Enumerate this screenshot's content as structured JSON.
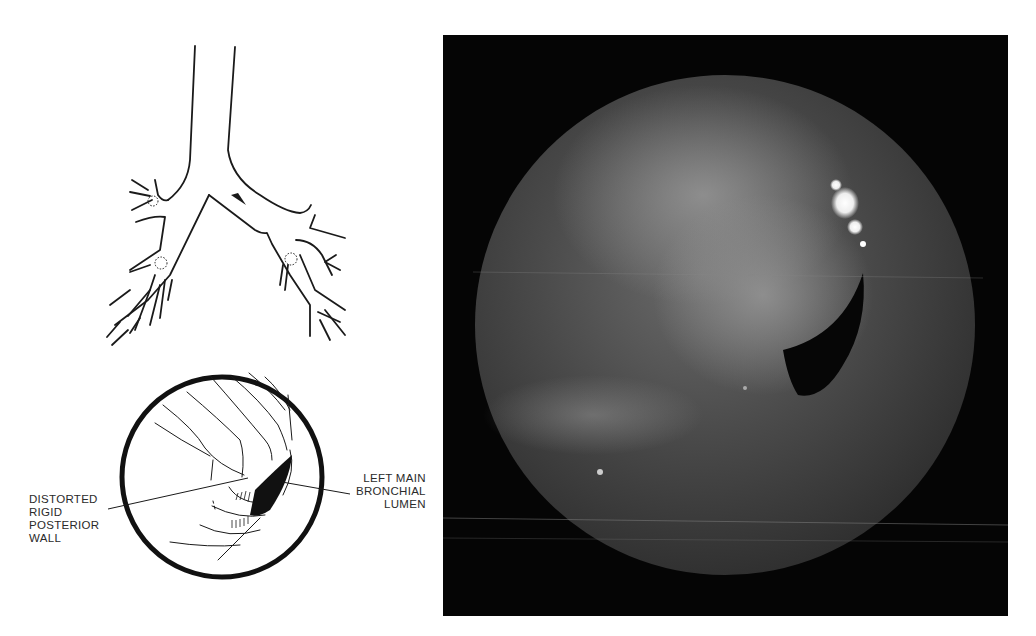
{
  "figure": {
    "type": "medical-figure",
    "panels": [
      {
        "name": "bronchial-tree-schematic",
        "description": "Line drawing of trachea and bronchial tree with arrow pointing to left main bronchus and dotted circles at segmental orifices"
      },
      {
        "name": "endoscopic-view-drawing",
        "description": "Circular bronchoscopic field sketch"
      },
      {
        "name": "bronchoscopic-photograph",
        "description": "Grayscale endoscopic photograph in circular field on black background"
      }
    ],
    "labels": {
      "left": "DISTORTED\nRIGID\nPOSTERIOR\nWALL",
      "right": "LEFT MAIN\nBRONCHIAL\nLUMEN"
    },
    "colors": {
      "ink": "#1a1a1a",
      "photo_background": "#050505",
      "photo_field": "#3a3a3a",
      "highlight": "#ffffff"
    }
  }
}
